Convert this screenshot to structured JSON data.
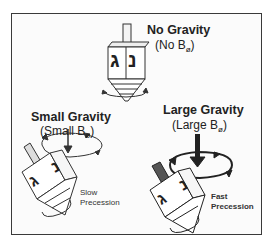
{
  "diagram": {
    "panels": [
      {
        "id": "no-gravity",
        "title": "No Gravity",
        "subtitle_prefix": "(No B",
        "subtitle_sub": "ø",
        "subtitle_suffix": ")"
      },
      {
        "id": "small-gravity",
        "title": "Small Gravity",
        "subtitle_prefix": "(Small B",
        "subtitle_sub": "ø",
        "subtitle_suffix": ")",
        "precession": [
          "Slow",
          "Precession"
        ]
      },
      {
        "id": "large-gravity",
        "title": "Large Gravity",
        "subtitle_prefix": "(Large B",
        "subtitle_sub": "ø",
        "subtitle_suffix": ")",
        "precession": [
          "Fast",
          "Precession"
        ]
      }
    ],
    "dreidel_letters": [
      "ג",
      "נ"
    ],
    "colors": {
      "frame": "#3a3a3a",
      "ink": "#222222",
      "handle_large": "#555555"
    }
  }
}
